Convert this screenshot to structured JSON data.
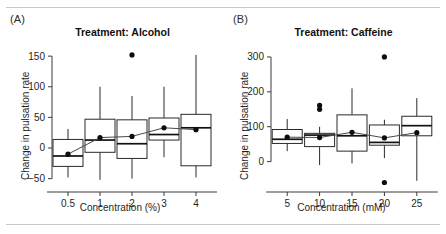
{
  "figure": {
    "width": 446,
    "height": 234,
    "background": "#ffffff",
    "rule_color": "#c9c9c9"
  },
  "panels": [
    {
      "letter": "(A)",
      "title": "Treatment: Alcohol",
      "ylabel": "Change in pulsation rate",
      "xlabel": "Concentration (%)"
    },
    {
      "letter": "(B)",
      "title": "Treatment: Caffeine",
      "ylabel": "Change in pulsation rate",
      "xlabel": "Concentration (mM)"
    }
  ],
  "chart_data": [
    {
      "type": "box",
      "title": "Treatment: Alcohol",
      "panel_label": "(A)",
      "xlabel": "Concentration (%)",
      "ylabel": "Change in pulsation rate",
      "categories": [
        "0.5",
        "1",
        "2",
        "3",
        "4"
      ],
      "ytick_labels": [
        "150",
        "100",
        "50",
        "0",
        "−50"
      ],
      "yticks": [
        150,
        100,
        50,
        0,
        -50
      ],
      "ylim": [
        -62,
        160
      ],
      "grid": false,
      "legend": "none",
      "boxes": [
        {
          "category": "0.5",
          "lower_whisker": -48,
          "q1": -30,
          "median": -13,
          "q3": 14,
          "upper_whisker": 31,
          "mean": -10,
          "outliers": []
        },
        {
          "category": "1",
          "lower_whisker": -52,
          "q1": -7,
          "median": 13,
          "q3": 47,
          "upper_whisker": 100,
          "mean": 17,
          "outliers": []
        },
        {
          "category": "2",
          "lower_whisker": -50,
          "q1": -17,
          "median": 7,
          "q3": 46,
          "upper_whisker": 85,
          "mean": 19,
          "outliers": [
            152
          ]
        },
        {
          "category": "3",
          "lower_whisker": -15,
          "q1": 13,
          "median": 22,
          "q3": 49,
          "upper_whisker": 100,
          "mean": 33,
          "outliers": []
        },
        {
          "category": "4",
          "lower_whisker": -48,
          "q1": -29,
          "median": 33,
          "q3": 55,
          "upper_whisker": 152,
          "mean": 30,
          "outliers": []
        }
      ],
      "mean_series": {
        "name": "mean",
        "values": [
          -10,
          17,
          19,
          33,
          30
        ]
      }
    },
    {
      "type": "box",
      "title": "Treatment: Caffeine",
      "panel_label": "(B)",
      "xlabel": "Concentration (mM)",
      "ylabel": "Change in pulsation rate",
      "categories": [
        "5",
        "10",
        "15",
        "20",
        "25"
      ],
      "ytick_labels": [
        "300",
        "200",
        "100",
        "0"
      ],
      "yticks": [
        300,
        200,
        100,
        0
      ],
      "ylim": [
        -70,
        320
      ],
      "grid": false,
      "legend": "none",
      "boxes": [
        {
          "category": "5",
          "lower_whisker": 30,
          "q1": 52,
          "median": 64,
          "q3": 92,
          "upper_whisker": 122,
          "mean": 70,
          "outliers": []
        },
        {
          "category": "10",
          "lower_whisker": -10,
          "q1": 43,
          "median": 76,
          "q3": 81,
          "upper_whisker": 100,
          "mean": 69,
          "outliers": [
            150,
            161
          ]
        },
        {
          "category": "15",
          "lower_whisker": -5,
          "q1": 30,
          "median": 74,
          "q3": 134,
          "upper_whisker": 210,
          "mean": 84,
          "outliers": []
        },
        {
          "category": "20",
          "lower_whisker": 10,
          "q1": 47,
          "median": 55,
          "q3": 105,
          "upper_whisker": 120,
          "mean": 68,
          "outliers": [
            300,
            -60
          ]
        },
        {
          "category": "25",
          "lower_whisker": -55,
          "q1": 74,
          "median": 103,
          "q3": 130,
          "upper_whisker": 182,
          "mean": 83,
          "outliers": []
        }
      ],
      "mean_series": {
        "name": "mean",
        "values": [
          70,
          69,
          84,
          68,
          83
        ]
      }
    }
  ]
}
